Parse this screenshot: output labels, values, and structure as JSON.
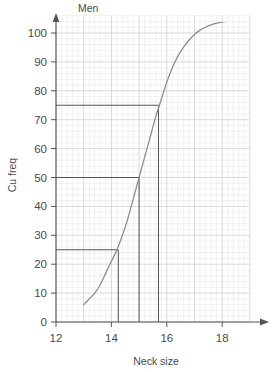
{
  "chart_data": {
    "type": "line",
    "title": "Men",
    "xlabel": "Neck size",
    "ylabel": "Cu freq",
    "xlim": [
      12,
      19
    ],
    "ylim": [
      0,
      106
    ],
    "xticks": [
      12,
      14,
      16,
      18
    ],
    "yticks": [
      0,
      10,
      20,
      30,
      40,
      50,
      60,
      70,
      80,
      90,
      100
    ],
    "grid": true,
    "grid_minor_step_x": 0.2,
    "grid_minor_step_y": 2,
    "grid_major_step_x": 1,
    "grid_major_step_y": 10,
    "legend": "none",
    "series": [
      {
        "name": "Cumulative frequency",
        "color": "#8c8c8c",
        "x": [
          13.0,
          13.2,
          13.4,
          13.6,
          13.8,
          14.0,
          14.2,
          14.4,
          14.6,
          14.8,
          15.0,
          15.2,
          15.4,
          15.6,
          15.8,
          16.0,
          16.2,
          16.4,
          16.6,
          16.8,
          17.0,
          17.2,
          17.4,
          17.6,
          17.8,
          18.0,
          18.2,
          18.4
        ],
        "y": [
          6,
          8,
          10,
          13,
          17,
          21,
          25,
          30,
          36,
          43,
          50,
          57,
          64,
          71,
          77,
          83,
          88,
          92,
          95,
          97.5,
          99.5,
          101,
          102,
          102.8,
          103.4,
          103.8,
          104,
          104
        ]
      }
    ],
    "annotations": [
      {
        "name": "lower-quartile",
        "cum_freq": 25,
        "neck_size": 14.25,
        "h_line_from_x": 12,
        "h_line_to_x": 14.25,
        "v_line_from_y": 25,
        "v_line_to_y": 0
      },
      {
        "name": "median",
        "cum_freq": 50,
        "neck_size": 15.0,
        "h_line_from_x": 12,
        "h_line_to_x": 15.0,
        "v_line_from_y": 50,
        "v_line_to_y": 0
      },
      {
        "name": "upper-quartile",
        "cum_freq": 75,
        "neck_size": 15.7,
        "h_line_from_x": 12,
        "h_line_to_x": 15.7,
        "v_line_from_y": 75,
        "v_line_to_y": 0
      }
    ],
    "colors": {
      "curve": "#8c8c8c",
      "axis": "#555555",
      "construction_line": "#555555",
      "grid_minor": "#e2e2e8",
      "grid_major": "#cfcfd6",
      "text": "#4a4a4a"
    }
  },
  "axes": {
    "y_tick_labels": [
      "0",
      "10",
      "20",
      "30",
      "40",
      "50",
      "60",
      "70",
      "80",
      "90",
      "100"
    ],
    "x_tick_labels": [
      "12",
      "14",
      "16",
      "18"
    ],
    "y_axis_title": "Cu freq",
    "x_axis_title": "Neck size"
  },
  "header": {
    "title": "Men"
  }
}
